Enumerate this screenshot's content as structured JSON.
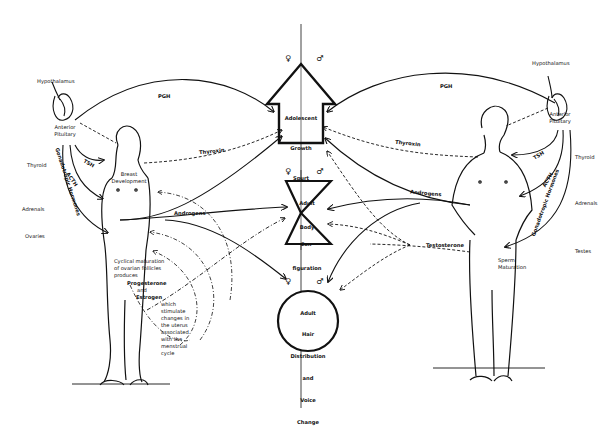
{
  "diagram": {
    "title": "",
    "central_axis": {
      "shapes": [
        {
          "id": "arrow",
          "label_lines": [
            "Adolescent",
            "|",
            "Growth",
            "|",
            "Spurt"
          ],
          "symbols": [
            "♀",
            "♂"
          ]
        },
        {
          "id": "hourglass",
          "label_lines": [
            "Adult",
            "Body",
            "",
            "Con-",
            "figuration"
          ],
          "symbols": [
            "♀",
            "♂"
          ]
        },
        {
          "id": "circle",
          "label_lines": [
            "Adult",
            "Hair",
            "Distribution",
            "and",
            "Voice",
            "Change"
          ],
          "symbols": [
            "♀",
            "♂"
          ]
        }
      ]
    },
    "female_side": {
      "hypothalamus": "Hypothalamus",
      "anterior_pituitary": "Anterior\nPituitary",
      "glands": [
        "Thyroid",
        "Adrenals",
        "Ovaries"
      ],
      "hormones": {
        "pgh": "PGH",
        "tsh": "TSH",
        "acth": "ACTH",
        "gonadotropic": "Gonadotropic Hormones",
        "thyroxin": "Thyroxin",
        "androgens": "Androgens"
      },
      "breast": "Breast\nDevelopment",
      "cycle_text": "Cyclical maturation\nof ovarian follicles\nproduces",
      "progesterone": "Progesterone",
      "and": "and",
      "estrogen": "Estrogen",
      "uterus_text": "which\nstimulate\nchanges in\nthe uterus\nassociated\nwith the\nmenstrual\ncycle"
    },
    "male_side": {
      "hypothalamus": "Hypothalamus",
      "anterior_pituitary": "Anterior\nPituitary",
      "glands": [
        "Thyroid",
        "Adrenals",
        "Testes"
      ],
      "hormones": {
        "pgh": "PGH",
        "tsh": "TSH",
        "acth": "ACTH",
        "gonadotropic": "Gonadotropic Hormones",
        "thyroxin": "Thyroxin",
        "androgens": "Androgens",
        "testosterone": "Testosterone"
      },
      "sperm": "Sperm\nMaturation"
    },
    "colors": {
      "ink": "#111111",
      "background": "#ffffff"
    }
  }
}
